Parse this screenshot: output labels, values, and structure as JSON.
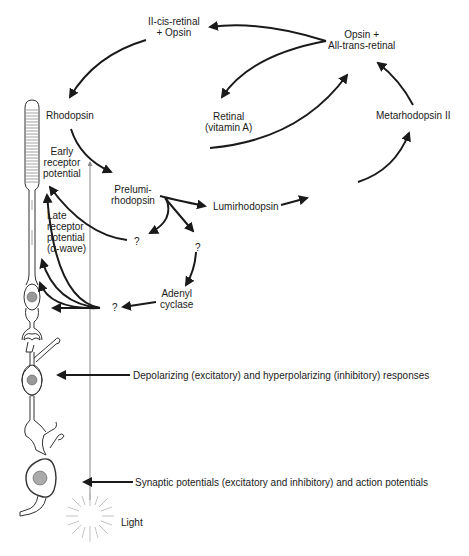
{
  "diagram": {
    "nodes": {
      "eleven_cis": {
        "line1": "II-cis-retinal",
        "line2": "+ Opsin"
      },
      "opsin_all_trans": {
        "line1": "Opsin +",
        "line2": "All-trans-retinal"
      },
      "retinal": {
        "line1": "Retinal",
        "line2": "(vitamin A)"
      },
      "rhodopsin": "Rhodopsin",
      "metarhodopsin_2": "Metarhodopsin II",
      "prelumirhodopsin": {
        "line1": "Prelumi-",
        "line2": "rhodopsin"
      },
      "lumirhodopsin": "Lumirhodopsin",
      "metarhodopsin_1": "Metarhodopsin I",
      "unknown_1": "?",
      "unknown_2": "?",
      "unknown_3": "?",
      "adenyl_cyclase": {
        "line1": "Adenyl",
        "line2": "cyclase"
      }
    },
    "responses": {
      "early_receptor": {
        "line1": "Early",
        "line2": "receptor",
        "line3": "potential"
      },
      "late_receptor": {
        "line1": "Late",
        "line2": "receptor",
        "line3": "potential",
        "line4": "(α-wave)"
      },
      "bipolar": "Depolarizing (excitatory) and hyperpolarizing (inhibitory) responses",
      "ganglion": "Synaptic potentials (excitatory and inhibitory) and action potentials"
    },
    "light": "Light",
    "colors": {
      "ink": "#1a1a1a",
      "light_ray": "#8a8a8a",
      "background": "#ffffff"
    }
  }
}
